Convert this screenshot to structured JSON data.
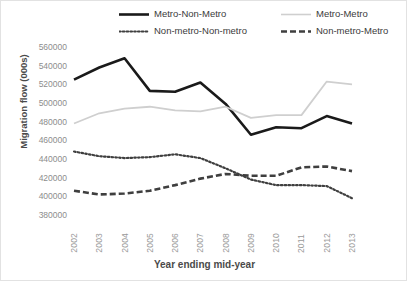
{
  "chart_data": {
    "type": "line",
    "title": "",
    "xlabel": "Year ending mid-year",
    "ylabel": "Migration flow (000s)",
    "categories": [
      "2002",
      "2003",
      "2004",
      "2005",
      "2006",
      "2007",
      "2008",
      "2009",
      "2010",
      "2011",
      "2012",
      "2013"
    ],
    "ylim": [
      380000,
      560000
    ],
    "ytick_values": [
      560000,
      540000,
      520000,
      500000,
      480000,
      460000,
      440000,
      420000,
      400000,
      380000
    ],
    "ytick_labels": [
      "560000",
      "540000",
      "520000",
      "500000",
      "480000",
      "460000",
      "440000",
      "420000",
      "400000",
      "380000"
    ],
    "grid": false,
    "legend_position": "top",
    "series": [
      {
        "name": "Metro-Non-Metro",
        "style": "solid",
        "color": "#1a1a1a",
        "values": [
          525000,
          538000,
          548000,
          513000,
          512000,
          522000,
          499000,
          466000,
          474000,
          473000,
          486000,
          478000
        ]
      },
      {
        "name": "Metro-Metro",
        "style": "solid-light",
        "color": "#cfcfcf",
        "values": [
          478000,
          489000,
          494000,
          496000,
          492000,
          491000,
          496000,
          484000,
          487000,
          487000,
          523000,
          520000
        ]
      },
      {
        "name": "Non-metro-Non-metro",
        "style": "dotted",
        "color": "#3f3f3f",
        "values": [
          448000,
          443000,
          441000,
          442000,
          445000,
          441000,
          430000,
          418000,
          412000,
          412000,
          411000,
          398000
        ]
      },
      {
        "name": "Non-metro-Metro",
        "style": "dashed",
        "color": "#3f3f3f",
        "values": [
          406000,
          402000,
          403000,
          406000,
          412000,
          419000,
          424000,
          422000,
          422000,
          431000,
          432000,
          427000
        ]
      }
    ]
  }
}
